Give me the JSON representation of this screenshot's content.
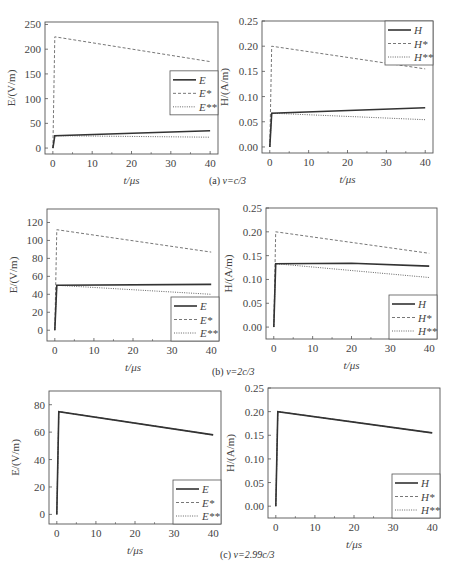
{
  "captions": [
    {
      "prefix": "(a) ",
      "text": "v=c/3"
    },
    {
      "prefix": "(b) ",
      "text": "v=2c/3"
    },
    {
      "prefix": "(c) ",
      "text": "v=2.99c/3"
    }
  ],
  "chart_data": [
    {
      "id": "a-E",
      "type": "line",
      "panel": "(a) v=c/3",
      "xlabel": "t/μs",
      "ylabel": "E/(V/m)",
      "xlim": [
        -2,
        42
      ],
      "ylim": [
        -12,
        255
      ],
      "xticks": [
        0,
        10,
        20,
        30,
        40
      ],
      "yticks": [
        0,
        50,
        100,
        150,
        200,
        250
      ],
      "ytick_labels": [
        "0",
        "50",
        "100",
        "150",
        "200",
        "250"
      ],
      "legend": {
        "position": "center-right",
        "entries": [
          "E",
          "E*",
          "E**"
        ]
      },
      "series": [
        {
          "name": "E",
          "style": "solid",
          "x": [
            0,
            0.5,
            40
          ],
          "y": [
            0,
            25,
            35
          ]
        },
        {
          "name": "E*",
          "style": "dashed",
          "x": [
            0,
            0.5,
            40
          ],
          "y": [
            0,
            225,
            175
          ]
        },
        {
          "name": "E**",
          "style": "dotted",
          "x": [
            0,
            0.5,
            40
          ],
          "y": [
            0,
            25,
            22
          ]
        }
      ]
    },
    {
      "id": "a-H",
      "type": "line",
      "panel": "(a) v=c/3",
      "xlabel": "t/μs",
      "ylabel": "H/(A/m)",
      "xlim": [
        -2,
        42
      ],
      "ylim": [
        -0.012,
        0.25
      ],
      "xticks": [
        0,
        10,
        20,
        30,
        40
      ],
      "yticks": [
        0,
        0.05,
        0.1,
        0.15,
        0.2,
        0.25
      ],
      "ytick_labels": [
        "0.00",
        "0.05",
        "0.10",
        "0.15",
        "0.20",
        "0.25"
      ],
      "legend": {
        "position": "upper-right",
        "entries": [
          "H",
          "H*",
          "H**"
        ]
      },
      "series": [
        {
          "name": "H",
          "style": "solid",
          "x": [
            0,
            0.5,
            40
          ],
          "y": [
            0,
            0.067,
            0.078
          ]
        },
        {
          "name": "H*",
          "style": "dashed",
          "x": [
            0,
            0.5,
            40
          ],
          "y": [
            0,
            0.2,
            0.155
          ]
        },
        {
          "name": "H**",
          "style": "dotted",
          "x": [
            0,
            0.5,
            40
          ],
          "y": [
            0,
            0.067,
            0.054
          ]
        }
      ]
    },
    {
      "id": "b-E",
      "type": "line",
      "panel": "(b) v=2c/3",
      "xlabel": "t/μs",
      "ylabel": "E/(V/m)",
      "xlim": [
        -2,
        42
      ],
      "ylim": [
        -12,
        135
      ],
      "xticks": [
        0,
        10,
        20,
        30,
        40
      ],
      "yticks": [
        0,
        20,
        40,
        60,
        80,
        100,
        120
      ],
      "ytick_labels": [
        "0",
        "20",
        "40",
        "60",
        "80",
        "100",
        "120"
      ],
      "legend": {
        "position": "lower-right",
        "entries": [
          "E",
          "E*",
          "E**"
        ]
      },
      "series": [
        {
          "name": "E",
          "style": "solid",
          "x": [
            0,
            0.5,
            40
          ],
          "y": [
            0,
            50,
            51
          ]
        },
        {
          "name": "E*",
          "style": "dashed",
          "x": [
            0,
            0.5,
            40
          ],
          "y": [
            0,
            112,
            87
          ]
        },
        {
          "name": "E**",
          "style": "dotted",
          "x": [
            0,
            0.5,
            40
          ],
          "y": [
            0,
            50,
            40
          ]
        }
      ]
    },
    {
      "id": "b-H",
      "type": "line",
      "panel": "(b) v=2c/3",
      "xlabel": "t/μs",
      "ylabel": "H/(A/m)",
      "xlim": [
        -2,
        42
      ],
      "ylim": [
        -0.025,
        0.25
      ],
      "xticks": [
        0,
        10,
        20,
        30,
        40
      ],
      "yticks": [
        0,
        0.05,
        0.1,
        0.15,
        0.2,
        0.25
      ],
      "ytick_labels": [
        "0.00",
        "0.05",
        "0.10",
        "0.15",
        "0.20",
        "0.25"
      ],
      "legend": {
        "position": "lower-right",
        "entries": [
          "H",
          "H*",
          "H**"
        ]
      },
      "series": [
        {
          "name": "H",
          "style": "solid",
          "x": [
            0,
            0.5,
            20,
            40
          ],
          "y": [
            0,
            0.133,
            0.134,
            0.128
          ]
        },
        {
          "name": "H*",
          "style": "dashed",
          "x": [
            0,
            0.5,
            40
          ],
          "y": [
            0,
            0.2,
            0.155
          ]
        },
        {
          "name": "H**",
          "style": "dotted",
          "x": [
            0,
            0.5,
            40
          ],
          "y": [
            0,
            0.133,
            0.104
          ]
        }
      ]
    },
    {
      "id": "c-E",
      "type": "line",
      "panel": "(c) v=2.99c/3",
      "xlabel": "t/μs",
      "ylabel": "E/(V/m)",
      "xlim": [
        -2,
        42
      ],
      "ylim": [
        -7,
        90
      ],
      "xticks": [
        0,
        10,
        20,
        30,
        40
      ],
      "yticks": [
        0,
        20,
        40,
        60,
        80
      ],
      "ytick_labels": [
        "0",
        "20",
        "40",
        "60",
        "80"
      ],
      "legend": {
        "position": "lower-right",
        "entries": [
          "E",
          "E*",
          "E**"
        ]
      },
      "series": [
        {
          "name": "E",
          "style": "solid",
          "x": [
            0,
            0.5,
            40
          ],
          "y": [
            0,
            75,
            58
          ]
        },
        {
          "name": "E*",
          "style": "dashed",
          "x": [
            0,
            0.5,
            40
          ],
          "y": [
            0,
            75,
            58
          ]
        },
        {
          "name": "E**",
          "style": "dotted",
          "x": [
            0,
            0.5,
            40
          ],
          "y": [
            0,
            75,
            58
          ]
        }
      ]
    },
    {
      "id": "c-H",
      "type": "line",
      "panel": "(c) v=2.99c/3",
      "xlabel": "t/μs",
      "ylabel": "H/(A/m)",
      "xlim": [
        -2,
        42
      ],
      "ylim": [
        -0.025,
        0.25
      ],
      "xticks": [
        0,
        10,
        20,
        30,
        40
      ],
      "yticks": [
        0,
        0.05,
        0.1,
        0.15,
        0.2,
        0.25
      ],
      "ytick_labels": [
        "0.00",
        "0.05",
        "0.10",
        "0.15",
        "0.20",
        "0.25"
      ],
      "legend": {
        "position": "lower-right",
        "entries": [
          "H",
          "H*",
          "H**"
        ]
      },
      "series": [
        {
          "name": "H",
          "style": "solid",
          "x": [
            0,
            0.5,
            40
          ],
          "y": [
            0,
            0.2,
            0.155
          ]
        },
        {
          "name": "H*",
          "style": "dashed",
          "x": [
            0,
            0.5,
            40
          ],
          "y": [
            0,
            0.2,
            0.155
          ]
        },
        {
          "name": "H**",
          "style": "dotted",
          "x": [
            0,
            0.5,
            40
          ],
          "y": [
            0,
            0.2,
            0.155
          ]
        }
      ]
    }
  ],
  "layout": [
    {
      "left": 45,
      "top": 22,
      "width": 173,
      "height": 132
    },
    {
      "left": 262,
      "top": 21,
      "width": 171,
      "height": 132
    },
    {
      "left": 47,
      "top": 209,
      "width": 172,
      "height": 132
    },
    {
      "left": 266,
      "top": 208,
      "width": 171,
      "height": 131
    },
    {
      "left": 49,
      "top": 391,
      "width": 172,
      "height": 133
    },
    {
      "left": 268,
      "top": 388,
      "width": 172,
      "height": 130
    }
  ],
  "caption_positions": [
    {
      "left": 209,
      "top": 175
    },
    {
      "left": 212,
      "top": 366
    },
    {
      "left": 220,
      "top": 549
    }
  ]
}
